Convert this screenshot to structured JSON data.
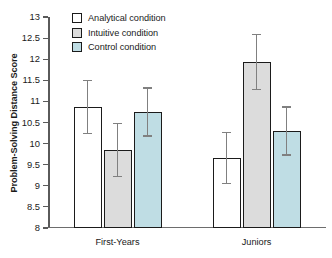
{
  "chart_data": {
    "type": "bar",
    "title": "",
    "xlabel": "",
    "ylabel": "Problem-Solving Distance Score",
    "ylim": [
      8,
      13
    ],
    "ytick_step": 0.5,
    "yticks": [
      "13",
      "12.5",
      "12",
      "11.5",
      "11",
      "10.5",
      "10",
      "9.5",
      "9",
      "8.5",
      "8"
    ],
    "grid": false,
    "legend_position": "top-left-inside",
    "categories": [
      "First-Years",
      "Juniors"
    ],
    "series": [
      {
        "name": "Analytical condition",
        "color": "#ffffff",
        "values": [
          10.87,
          9.66
        ],
        "errors": [
          0.63,
          0.61
        ]
      },
      {
        "name": "Intuitive condition",
        "color": "#dcdcdc",
        "values": [
          9.85,
          11.93
        ],
        "errors": [
          0.63,
          0.65
        ]
      },
      {
        "name": "Control condition",
        "color": "#bfdde4",
        "values": [
          10.75,
          10.3
        ],
        "errors": [
          0.57,
          0.57
        ]
      }
    ]
  }
}
